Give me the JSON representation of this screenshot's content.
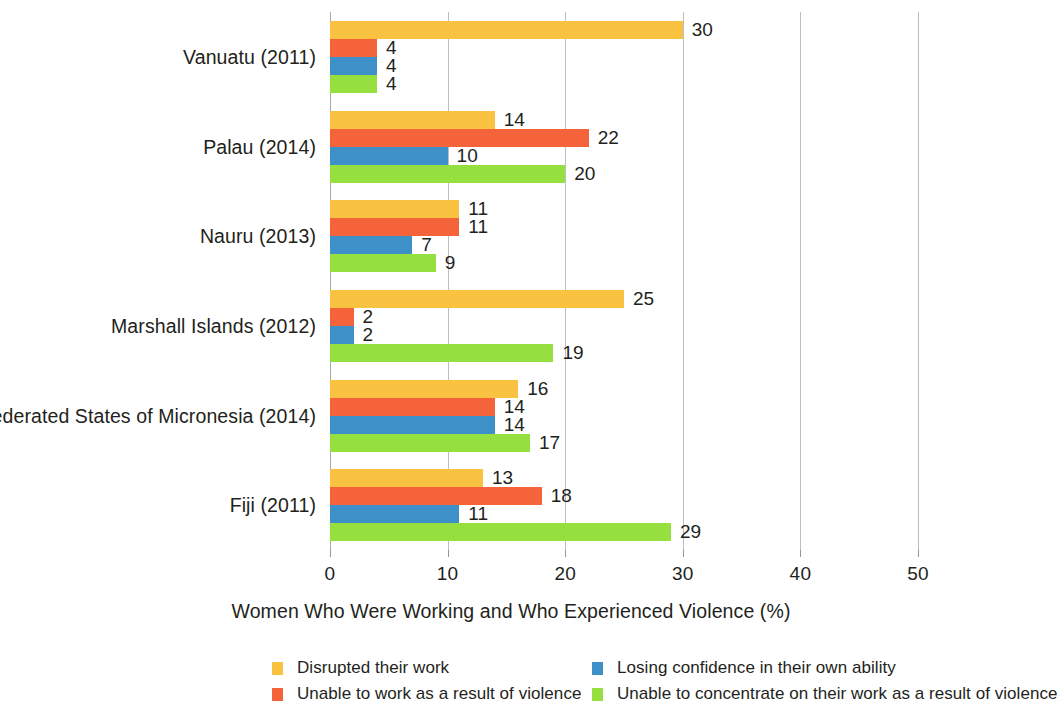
{
  "chart_data": {
    "type": "bar",
    "orientation": "horizontal",
    "title": "",
    "xlabel": "Women Who Were Working and Who Experienced Violence (%)",
    "ylabel": "",
    "xlim": [
      0,
      50
    ],
    "xticks": [
      0,
      10,
      20,
      30,
      40,
      50
    ],
    "xtick_labels": [
      "0",
      "10",
      "20",
      "30",
      "40",
      "50"
    ],
    "grid": "vertical",
    "legend_position": "bottom",
    "categories": [
      "Vanuatu (2011)",
      "Palau (2014)",
      "Nauru (2013)",
      "Marshall Islands (2012)",
      "Federated States of Micronesia (2014)",
      "Fiji (2011)"
    ],
    "series": [
      {
        "name": "Disrupted their work",
        "color": "#f9c240",
        "values": [
          30,
          14,
          11,
          25,
          16,
          13
        ]
      },
      {
        "name": "Unable to work as a result of violence",
        "color": "#f4633a",
        "values": [
          4,
          22,
          11,
          2,
          14,
          18
        ]
      },
      {
        "name": "Losing confidence in their own ability",
        "color": "#3e90c8",
        "values": [
          4,
          10,
          7,
          2,
          14,
          11
        ]
      },
      {
        "name": "Unable to concentrate on their work as a result of violence",
        "color": "#95e03e",
        "values": [
          4,
          20,
          9,
          19,
          17,
          29
        ]
      }
    ],
    "data_labels": [
      [
        "30",
        "4",
        "4",
        "4"
      ],
      [
        "14",
        "22",
        "10",
        "20"
      ],
      [
        "11",
        "11",
        "7",
        "9"
      ],
      [
        "25",
        "2",
        "2",
        "19"
      ],
      [
        "16",
        "14",
        "14",
        "17"
      ],
      [
        "13",
        "18",
        "11",
        "29"
      ]
    ]
  },
  "legend": {
    "entries": [
      {
        "label": "Disrupted their work",
        "color": "#f9c240",
        "icon": "legend-swatch-yellow"
      },
      {
        "label": "Losing confidence in their own ability",
        "color": "#3e90c8",
        "icon": "legend-swatch-blue"
      },
      {
        "label": "Unable to work as a result of violence",
        "color": "#f4633a",
        "icon": "legend-swatch-orange"
      },
      {
        "label": "Unable to concentrate on their work as a result of violence",
        "color": "#95e03e",
        "icon": "legend-swatch-green"
      }
    ]
  }
}
